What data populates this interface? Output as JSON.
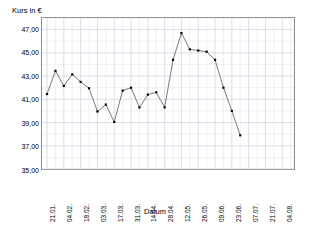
{
  "chart_data": {
    "type": "line",
    "title": "",
    "ylabel": "Kurs in €",
    "xlabel": "Datum",
    "ylim": [
      35.0,
      48.0
    ],
    "yticks": [
      "35,00",
      "37,00",
      "39,00",
      "41,00",
      "43,00",
      "45,00",
      "47,00"
    ],
    "ytick_values": [
      35.0,
      37.0,
      39.0,
      41.0,
      43.0,
      45.0,
      47.0
    ],
    "xticks": [
      "21.01.",
      "04.02.",
      "18.02.",
      "03.03.",
      "17.03.",
      "31.03.",
      "14.04.",
      "28.04.",
      "12.05.",
      "26.05.",
      "09.06.",
      "23.06.",
      "07.07.",
      "21.07.",
      "04.08."
    ],
    "grid": true,
    "legend": false,
    "marker": "filled-square",
    "line_color": "#555555",
    "marker_color": "#000000",
    "grid_color": "#c8d0dd",
    "series": [
      {
        "name": "Kurs",
        "x": [
          "21.01.",
          "28.01.",
          "04.02.",
          "11.02.",
          "18.02.",
          "25.02.",
          "03.03.",
          "10.03.",
          "17.03.",
          "24.03.",
          "31.03.",
          "07.04.",
          "14.04.",
          "21.04.",
          "28.04.",
          "05.05.",
          "12.05.",
          "19.05.",
          "26.05.",
          "02.06.",
          "09.06.",
          "16.06.",
          "23.06.",
          "30.06."
        ],
        "values": [
          41.45,
          43.45,
          42.15,
          43.15,
          42.5,
          41.95,
          39.95,
          40.55,
          39.05,
          41.75,
          42.0,
          40.3,
          41.4,
          41.6,
          40.3,
          44.4,
          46.7,
          45.3,
          45.2,
          45.1,
          44.4,
          42.0,
          40.0,
          37.9
        ]
      }
    ]
  },
  "axes": {
    "y_title": "Kurs in €",
    "x_title": "Datum"
  }
}
